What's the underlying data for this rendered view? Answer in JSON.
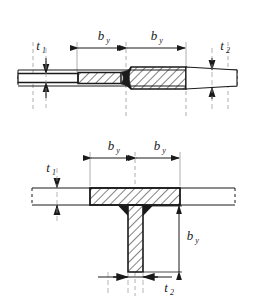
{
  "figure": {
    "background_color": "#ffffff",
    "line_color": "#1a1a1a",
    "weld_fill_color": "#1a1a1a",
    "hatch_color": "#1a1a1a"
  },
  "labels": {
    "by": "b",
    "by_sub": "y",
    "t1": "t",
    "t1_sub": "1",
    "t2": "t",
    "t2_sub": "2"
  },
  "top_view": {
    "name": "butt-weld-transition-joint",
    "description": "Two plates of unequal thickness joined by a tapered butt weld, shown in longitudinal section",
    "dimensions": [
      {
        "name": "by-left",
        "label": "b",
        "subscript": "y",
        "orientation": "horizontal"
      },
      {
        "name": "by-right",
        "label": "b",
        "subscript": "y",
        "orientation": "horizontal"
      },
      {
        "name": "t1",
        "label": "t",
        "subscript": "1",
        "orientation": "vertical",
        "side": "left"
      },
      {
        "name": "t2",
        "label": "t",
        "subscript": "2",
        "orientation": "vertical",
        "side": "right"
      }
    ]
  },
  "bottom_view": {
    "name": "tee-joint-fillet-weld",
    "description": "T-joint of flange plate and web plate with double fillet welds, shown in cross section",
    "dimensions": [
      {
        "name": "by-left",
        "label": "b",
        "subscript": "y",
        "orientation": "horizontal"
      },
      {
        "name": "by-right",
        "label": "b",
        "subscript": "y",
        "orientation": "horizontal"
      },
      {
        "name": "by-vertical",
        "label": "b",
        "subscript": "y",
        "orientation": "vertical"
      },
      {
        "name": "t1",
        "label": "t",
        "subscript": "1",
        "orientation": "vertical",
        "side": "left"
      },
      {
        "name": "t2",
        "label": "t",
        "subscript": "2",
        "orientation": "horizontal",
        "side": "bottom"
      }
    ]
  }
}
